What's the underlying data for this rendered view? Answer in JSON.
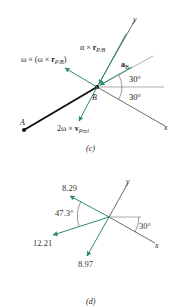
{
  "colors": {
    "vector": "#2e8b6e",
    "axis": "#444444",
    "bar": "#111111",
    "text": "#222222"
  },
  "part_c": {
    "caption": "(c)",
    "point_a": "A",
    "point_b": "B",
    "axis_x": "x",
    "axis_y": "y",
    "angle_upper": "30°",
    "angle_lower": "30°",
    "vectors": {
      "centripetal": {
        "pre": "ω × (ω × ",
        "bold": "r",
        "sub": "P/B",
        "post": ")"
      },
      "tangential": {
        "pre": "α × ",
        "bold": "r",
        "sub": "P/B",
        "post": ""
      },
      "accel_b": {
        "pre": "",
        "bold": "a",
        "sub": "B",
        "post": ""
      },
      "coriolis": {
        "pre": "2ω × ",
        "bold": "v",
        "sub": "Prel",
        "post": ""
      }
    }
  },
  "part_d": {
    "caption": "(d)",
    "axis_x": "x",
    "axis_y": "y",
    "angle_between": "47.3°",
    "angle_axis": "30°",
    "vectors": [
      {
        "label": "8.29"
      },
      {
        "label": "12.21"
      },
      {
        "label": "8.97"
      }
    ]
  }
}
